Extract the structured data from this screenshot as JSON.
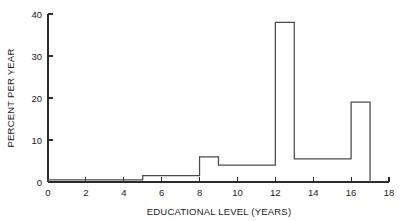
{
  "chart_data": {
    "type": "bar",
    "title": "",
    "xlabel": "EDUCATIONAL LEVEL (YEARS)",
    "ylabel": "PERCENT PER YEAR",
    "xlim": [
      0,
      18
    ],
    "ylim": [
      0,
      40
    ],
    "grid": false,
    "legend": null,
    "xticks": [
      0,
      2,
      4,
      6,
      8,
      10,
      12,
      14,
      16,
      18
    ],
    "xtick_labels": [
      "0",
      "2",
      "4",
      "6",
      "8",
      "10",
      "12",
      "14",
      "16",
      "18"
    ],
    "yticks": [
      0,
      10,
      20,
      30,
      40
    ],
    "ytick_labels": [
      "0",
      "10",
      "20",
      "30",
      "40"
    ],
    "bin_edges": [
      0,
      5,
      8,
      9,
      12,
      13,
      16,
      17
    ],
    "values": [
      0.5,
      1.5,
      6,
      4,
      38,
      5.5,
      19
    ],
    "categories": [
      "0-5",
      "5-8",
      "8-9",
      "9-12",
      "12-13",
      "13-16",
      "16-17"
    ],
    "bar_color": "#ffffff",
    "bar_edge_color": "#4a4a4a",
    "axis_color": "#2b2b2b"
  }
}
